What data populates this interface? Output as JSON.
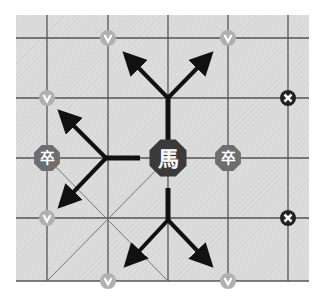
{
  "board": {
    "background": "#dcdcdc",
    "grid_color": "#555555",
    "x_lines": [
      47,
      108,
      168,
      228,
      288
    ],
    "y_lines": [
      38,
      98,
      158,
      218,
      281
    ],
    "left": 16,
    "top": 15,
    "right": 309,
    "bottom": 281
  },
  "colors": {
    "horse": "#3a3a3a",
    "soldier": "#6e6e6e",
    "valid_marker": "#b0b0b0",
    "blocked_marker": "#222222",
    "arrow": "#111111",
    "piece_text": "#ffffff"
  },
  "pieces": [
    {
      "name": "horse",
      "label": "馬",
      "x": 168,
      "y": 158,
      "size": 20
    },
    {
      "name": "soldier-left",
      "label": "卒",
      "x": 47,
      "y": 158,
      "size": 14
    },
    {
      "name": "soldier-right",
      "label": "卒",
      "x": 228,
      "y": 158,
      "size": 14
    }
  ],
  "valid_markers": [
    {
      "x": 108,
      "y": 38
    },
    {
      "x": 228,
      "y": 38
    },
    {
      "x": 47,
      "y": 98
    },
    {
      "x": 47,
      "y": 218
    },
    {
      "x": 108,
      "y": 281
    },
    {
      "x": 228,
      "y": 281
    }
  ],
  "valid_marker_glyph": "v",
  "blocked_markers": [
    {
      "x": 288,
      "y": 98
    },
    {
      "x": 288,
      "y": 218
    }
  ],
  "blocked_marker_glyph": "✕"
}
